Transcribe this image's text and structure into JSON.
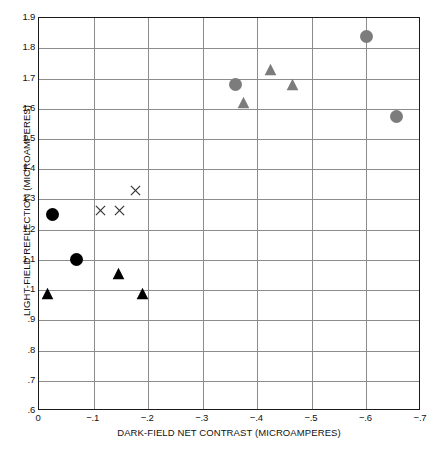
{
  "chart_data": {
    "type": "scatter",
    "title": "",
    "xlabel": "DARK-FIELD NET CONTRAST (MICROAMPERES)",
    "ylabel": "LIGHT-FIELD REFLECTION (MICROAMPERES)",
    "xlim": [
      0,
      -0.7
    ],
    "ylim": [
      0.6,
      1.9
    ],
    "grid": true,
    "legend": "none",
    "xticks": [
      {
        "value": 0,
        "label": "0"
      },
      {
        "value": -0.1,
        "label": "−.1"
      },
      {
        "value": -0.2,
        "label": "−.2"
      },
      {
        "value": -0.3,
        "label": "−.3"
      },
      {
        "value": -0.4,
        "label": "−.4"
      },
      {
        "value": -0.5,
        "label": "−.5"
      },
      {
        "value": -0.6,
        "label": "−.6"
      },
      {
        "value": -0.7,
        "label": "−.7"
      }
    ],
    "yticks": [
      {
        "value": 1.9,
        "label": "1.9"
      },
      {
        "value": 1.8,
        "label": "1.8"
      },
      {
        "value": 1.7,
        "label": "1.7"
      },
      {
        "value": 1.6,
        "label": "1.6"
      },
      {
        "value": 1.5,
        "label": "1.5"
      },
      {
        "value": 1.4,
        "label": "1.4"
      },
      {
        "value": 1.3,
        "label": "1.3"
      },
      {
        "value": 1.2,
        "label": "1.2"
      },
      {
        "value": 1.1,
        "label": "1.1"
      },
      {
        "value": 1.0,
        "label": "1"
      },
      {
        "value": 0.9,
        "label": ".9"
      },
      {
        "value": 0.8,
        "label": ".8"
      },
      {
        "value": 0.7,
        "label": ".7"
      },
      {
        "value": 0.6,
        "label": ".6"
      }
    ],
    "series": [
      {
        "name": "black-circle",
        "marker": "circle",
        "color": "#000000",
        "size": 13,
        "points": [
          {
            "x": -0.025,
            "y": 1.25
          },
          {
            "x": -0.068,
            "y": 1.1
          }
        ]
      },
      {
        "name": "black-triangle",
        "marker": "triangle",
        "color": "#000000",
        "size": 13,
        "points": [
          {
            "x": -0.015,
            "y": 0.99
          },
          {
            "x": -0.145,
            "y": 1.055
          },
          {
            "x": -0.19,
            "y": 0.99
          }
        ]
      },
      {
        "name": "x-mark",
        "marker": "x",
        "color": "#333333",
        "size": 11,
        "points": [
          {
            "x": -0.113,
            "y": 1.265
          },
          {
            "x": -0.148,
            "y": 1.265
          },
          {
            "x": -0.177,
            "y": 1.33
          }
        ]
      },
      {
        "name": "gray-circle",
        "marker": "circle",
        "color": "#7c7c7c",
        "size": 13,
        "points": [
          {
            "x": -0.36,
            "y": 1.68
          },
          {
            "x": -0.6,
            "y": 1.84
          },
          {
            "x": -0.655,
            "y": 1.575
          }
        ]
      },
      {
        "name": "gray-triangle",
        "marker": "triangle",
        "color": "#7c7c7c",
        "size": 13,
        "points": [
          {
            "x": -0.375,
            "y": 1.62
          },
          {
            "x": -0.425,
            "y": 1.73
          },
          {
            "x": -0.465,
            "y": 1.68
          }
        ]
      }
    ]
  },
  "colors": {
    "axis": "#1a1a1a",
    "grid": "#8c8c8c",
    "black_marker": "#000000",
    "gray_marker": "#7c7c7c",
    "background": "#ffffff"
  }
}
